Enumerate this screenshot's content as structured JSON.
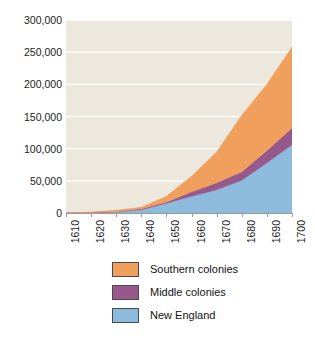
{
  "chart_data": {
    "type": "area",
    "stacked": true,
    "title": "",
    "subtitle": "",
    "xlabel": "",
    "ylabel": "",
    "x": [
      1610,
      1620,
      1630,
      1640,
      1650,
      1660,
      1670,
      1680,
      1690,
      1700
    ],
    "categories": [
      "1610",
      "1620",
      "1630",
      "1640",
      "1650",
      "1660",
      "1670",
      "1680",
      "1690",
      "1700"
    ],
    "xlim": [
      1610,
      1700
    ],
    "ylim": [
      0,
      300000
    ],
    "yticks": [
      0,
      50000,
      100000,
      150000,
      200000,
      250000,
      300000
    ],
    "ytick_labels": [
      "0",
      "50,000",
      "100,000",
      "150,000",
      "200,000",
      "250,000",
      "300,000"
    ],
    "xtick_labels": [
      "1610",
      "1620",
      "1630",
      "1640",
      "1650",
      "1660",
      "1670",
      "1680",
      "1690",
      "1700"
    ],
    "grid": true,
    "grid_color": "#ffffff",
    "plot_background": "#ece8dd",
    "legend_position": "bottom",
    "series": [
      {
        "name": "New England",
        "color": "#8cbbdd",
        "values": [
          0,
          500,
          1800,
          5000,
          15000,
          26000,
          36000,
          51000,
          78000,
          106000
        ]
      },
      {
        "name": "Middle colonies",
        "color": "#97588c",
        "values": [
          0,
          300,
          600,
          1500,
          2000,
          7000,
          11000,
          13000,
          19000,
          26000
        ]
      },
      {
        "name": "Southern colonies",
        "color": "#f0a05c",
        "values": [
          0,
          700,
          2000,
          2500,
          9000,
          24000,
          48000,
          88000,
          103000,
          126000
        ]
      }
    ],
    "cumulative_totals": [
      0,
      1500,
      4400,
      9000,
      26000,
      57000,
      95000,
      152000,
      200000,
      258000
    ]
  },
  "legend": {
    "items": [
      {
        "label": "Southern colonies",
        "color": "#f0a05c"
      },
      {
        "label": "Middle colonies",
        "color": "#97588c"
      },
      {
        "label": "New England",
        "color": "#8cbbdd"
      }
    ]
  }
}
